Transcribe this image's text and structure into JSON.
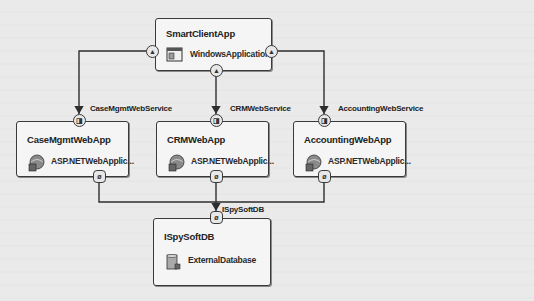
{
  "diagram": {
    "type": "application-architecture",
    "nodes": {
      "smart_client": {
        "name": "SmartClientApp",
        "type": "WindowsApplication",
        "icon": "windows-application-icon"
      },
      "case_mgmt": {
        "name": "CaseMgmtWebApp",
        "type": "ASP.NETWebApplic...",
        "icon": "aspnet-web-application-icon"
      },
      "crm": {
        "name": "CRMWebApp",
        "type": "ASP.NETWebApplic...",
        "icon": "aspnet-web-application-icon"
      },
      "accounting": {
        "name": "AccountingWebApp",
        "type": "ASP.NETWebApplic...",
        "icon": "aspnet-web-application-icon"
      },
      "db": {
        "name": "ISpySoftDB",
        "type": "ExternalDatabase",
        "icon": "external-database-icon"
      }
    },
    "connections": [
      {
        "from": "SmartClientApp",
        "to": "CaseMgmtWebApp",
        "label": "CaseMgmtWebService"
      },
      {
        "from": "SmartClientApp",
        "to": "CRMWebApp",
        "label": "CRMWebService"
      },
      {
        "from": "SmartClientApp",
        "to": "AccountingWebApp",
        "label": "AccountingWebService"
      },
      {
        "from": "CaseMgmtWebApp",
        "to": "ISpySoftDB",
        "label": "ISpySoftDB"
      },
      {
        "from": "CRMWebApp",
        "to": "ISpySoftDB",
        "label": "ISpySoftDB"
      },
      {
        "from": "AccountingWebApp",
        "to": "ISpySoftDB",
        "label": "ISpySoftDB"
      }
    ],
    "labels": {
      "case_mgmt_ws": "CaseMgmtWebService",
      "crm_ws": "CRMWebService",
      "accounting_ws": "AccountingWebService",
      "db_conn": "ISpySoftDB"
    },
    "port_glyphs": {
      "web_service": "⚠",
      "consumer": "ⓔ",
      "database": "⌀"
    },
    "colors": {
      "line": "#2e2e2e",
      "box_fill": "#f5f5f5",
      "background": "#eaeaea"
    }
  }
}
